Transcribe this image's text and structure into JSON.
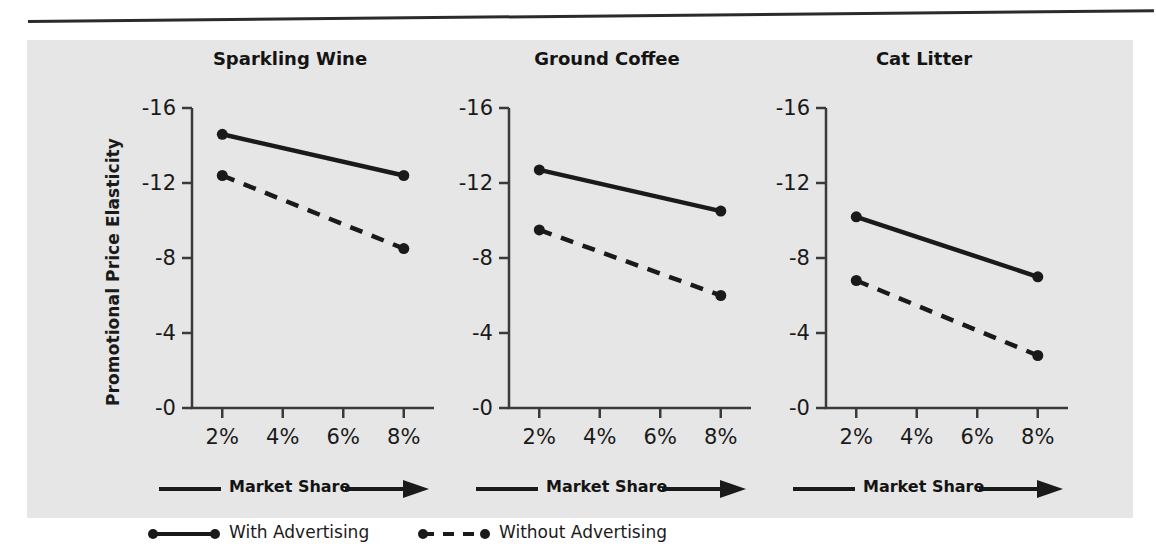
{
  "figure": {
    "y_axis_title": "Promotional Price Elasticity",
    "x_axis_caption": "Market Share",
    "legend": [
      {
        "key": "with",
        "label": "With Advertising",
        "style": "solid"
      },
      {
        "key": "without",
        "label": "Without Advertising",
        "style": "dashed"
      }
    ]
  },
  "chart_data": {
    "type": "line",
    "title": "",
    "xlabel": "Market Share",
    "ylabel": "Promotional Price Elasticity",
    "x": [
      2,
      4,
      6,
      8
    ],
    "categories": [
      "2%",
      "4%",
      "6%",
      "8%"
    ],
    "xtick_labels": [
      "2%",
      "4%",
      "6%",
      "8%"
    ],
    "ytick_labels": [
      "-16",
      "-12",
      "-8",
      "-4",
      "-0"
    ],
    "ytick_values": [
      -16,
      -12,
      -8,
      -4,
      0
    ],
    "ylim": [
      0,
      -16
    ],
    "xlim": [
      1,
      9
    ],
    "grid": false,
    "legend_position": "bottom",
    "panels": [
      {
        "title": "Sparkling Wine",
        "series": [
          {
            "name": "With Advertising",
            "style": "solid",
            "x": [
              2,
              8
            ],
            "values": [
              -14.6,
              -12.4
            ]
          },
          {
            "name": "Without Advertising",
            "style": "dashed",
            "x": [
              2,
              8
            ],
            "values": [
              -12.4,
              -8.5
            ]
          }
        ]
      },
      {
        "title": "Ground Coffee",
        "series": [
          {
            "name": "With Advertising",
            "style": "solid",
            "x": [
              2,
              8
            ],
            "values": [
              -12.7,
              -10.5
            ]
          },
          {
            "name": "Without Advertising",
            "style": "dashed",
            "x": [
              2,
              8
            ],
            "values": [
              -9.5,
              -6.0
            ]
          }
        ]
      },
      {
        "title": "Cat Litter",
        "series": [
          {
            "name": "With Advertising",
            "style": "solid",
            "x": [
              2,
              8
            ],
            "values": [
              -10.2,
              -7.0
            ]
          },
          {
            "name": "Without Advertising",
            "style": "dashed",
            "x": [
              2,
              8
            ],
            "values": [
              -6.8,
              -2.8
            ]
          }
        ]
      }
    ]
  }
}
